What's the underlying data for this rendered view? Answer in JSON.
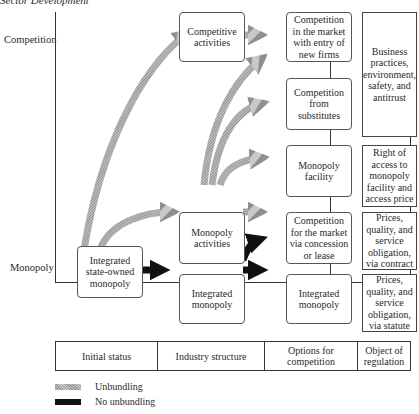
{
  "caption": "Sector Development",
  "axis": {
    "top_label": "Competition",
    "bottom_label": "Monopoly"
  },
  "nodes": {
    "integrated_state_owned": "Integrated state-owned monopoly",
    "competitive_activities": "Competitive activities",
    "monopoly_activities": "Monopoly activities",
    "integrated_monopoly_mid": "Integrated monopoly",
    "competition_entry": "Competition in the market with entry of new firms",
    "competition_substitutes": "Competition from substitutes",
    "monopoly_facility": "Monopoly facility",
    "competition_concession": "Competition for the market via concession or lease",
    "integrated_monopoly_right": "Integrated monopoly"
  },
  "regulation": {
    "business": "Business practices, environment, safety, and antitrust",
    "access": "Right of access to monopoly facility and access price",
    "contract": "Prices, quality, and service obligation, via contract",
    "statute": "Prices, quality, and service obligation, via statute"
  },
  "footer": [
    "Initial status",
    "Industry structure",
    "Options for competition",
    "Object of regulation"
  ],
  "legend": {
    "unbundling": "Unbundling",
    "no_unbundling": "No unbundling"
  },
  "colors": {
    "unbundling": "#a8a8a8",
    "no_unbundling": "#111111"
  }
}
